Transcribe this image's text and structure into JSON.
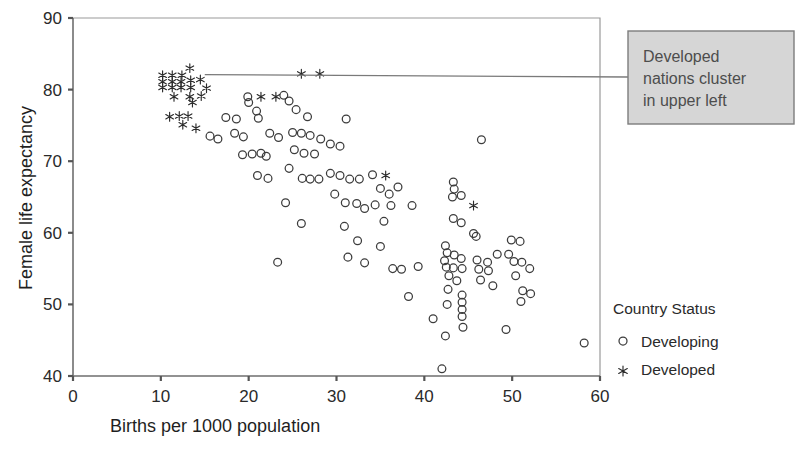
{
  "chart_data": {
    "type": "scatter",
    "title": "",
    "xlabel": "Births per 1000 population",
    "ylabel": "Female life expectancy",
    "xlim": [
      0,
      60
    ],
    "ylim": [
      40,
      90
    ],
    "xticks": [
      0,
      10,
      20,
      30,
      40,
      50,
      60
    ],
    "yticks": [
      40,
      50,
      60,
      70,
      80,
      90
    ],
    "grid": false,
    "legend": {
      "title": "Country Status",
      "position": "right",
      "entries": [
        {
          "label": "Developing",
          "marker": "open-circle"
        },
        {
          "label": "Developed",
          "marker": "asterisk"
        }
      ]
    },
    "annotations": [
      {
        "text_lines": [
          "Developed",
          "nations cluster",
          "in upper left"
        ],
        "box_fill": "#d6d6d6",
        "box_stroke": "#7d7d7d",
        "leader_from": [
          15.0,
          82.1
        ],
        "leader_to": [
          63.3,
          81.8
        ]
      }
    ],
    "series": [
      {
        "name": "Developed",
        "marker": "asterisk",
        "color": "#2b2b2b",
        "points": [
          [
            10.2,
            82.0
          ],
          [
            11.3,
            82.0
          ],
          [
            12.4,
            82.0
          ],
          [
            13.3,
            83.0
          ],
          [
            10.2,
            81.1
          ],
          [
            11.3,
            81.1
          ],
          [
            12.3,
            81.1
          ],
          [
            13.4,
            81.3
          ],
          [
            14.5,
            81.4
          ],
          [
            10.2,
            80.3
          ],
          [
            11.3,
            80.3
          ],
          [
            12.3,
            80.3
          ],
          [
            13.4,
            80.3
          ],
          [
            15.2,
            80.2
          ],
          [
            11.5,
            79.0
          ],
          [
            13.3,
            79.0
          ],
          [
            14.6,
            79.1
          ],
          [
            13.6,
            78.2
          ],
          [
            11.0,
            76.2
          ],
          [
            12.1,
            76.3
          ],
          [
            13.1,
            76.3
          ],
          [
            12.5,
            75.1
          ],
          [
            14.0,
            74.6
          ],
          [
            21.4,
            79.0
          ],
          [
            23.1,
            79.0
          ],
          [
            26.0,
            82.2
          ],
          [
            28.1,
            82.2
          ],
          [
            35.6,
            68.0
          ],
          [
            45.6,
            63.8
          ]
        ]
      },
      {
        "name": "Developing",
        "marker": "open-circle",
        "color": "#3c3c3c",
        "points": [
          [
            17.4,
            76.1
          ],
          [
            18.6,
            75.9
          ],
          [
            19.9,
            79.0
          ],
          [
            20.0,
            78.2
          ],
          [
            18.4,
            73.9
          ],
          [
            19.4,
            73.4
          ],
          [
            16.5,
            73.1
          ],
          [
            15.6,
            73.5
          ],
          [
            20.9,
            77.0
          ],
          [
            21.1,
            76.0
          ],
          [
            22.4,
            73.9
          ],
          [
            23.4,
            73.3
          ],
          [
            20.4,
            71.0
          ],
          [
            21.4,
            71.1
          ],
          [
            22.0,
            70.7
          ],
          [
            19.3,
            70.9
          ],
          [
            21.0,
            68.0
          ],
          [
            22.2,
            67.6
          ],
          [
            24.0,
            79.2
          ],
          [
            24.6,
            78.4
          ],
          [
            25.4,
            77.2
          ],
          [
            26.7,
            76.2
          ],
          [
            25.0,
            74.0
          ],
          [
            26.0,
            73.9
          ],
          [
            27.0,
            73.6
          ],
          [
            25.2,
            71.6
          ],
          [
            26.3,
            71.1
          ],
          [
            27.5,
            71.0
          ],
          [
            24.6,
            69.0
          ],
          [
            26.1,
            67.6
          ],
          [
            27.0,
            67.5
          ],
          [
            28.0,
            67.5
          ],
          [
            24.2,
            64.2
          ],
          [
            26.0,
            61.3
          ],
          [
            23.3,
            55.9
          ],
          [
            28.2,
            73.1
          ],
          [
            29.3,
            72.4
          ],
          [
            30.4,
            72.1
          ],
          [
            31.1,
            75.9
          ],
          [
            29.3,
            68.3
          ],
          [
            30.4,
            68.0
          ],
          [
            31.5,
            67.5
          ],
          [
            32.6,
            67.5
          ],
          [
            29.8,
            65.4
          ],
          [
            31.0,
            64.2
          ],
          [
            32.3,
            64.1
          ],
          [
            33.2,
            63.4
          ],
          [
            30.9,
            60.9
          ],
          [
            32.4,
            58.9
          ],
          [
            31.3,
            56.6
          ],
          [
            33.2,
            55.8
          ],
          [
            34.1,
            68.1
          ],
          [
            35.0,
            66.2
          ],
          [
            36.0,
            65.4
          ],
          [
            37.0,
            66.4
          ],
          [
            34.4,
            63.9
          ],
          [
            36.2,
            63.8
          ],
          [
            35.4,
            61.6
          ],
          [
            35.0,
            58.1
          ],
          [
            36.4,
            55.0
          ],
          [
            37.4,
            54.9
          ],
          [
            38.2,
            51.1
          ],
          [
            38.6,
            63.8
          ],
          [
            39.3,
            55.3
          ],
          [
            41.0,
            48.0
          ],
          [
            42.0,
            41.0
          ],
          [
            43.3,
            67.1
          ],
          [
            43.4,
            66.1
          ],
          [
            43.2,
            65.0
          ],
          [
            44.2,
            65.2
          ],
          [
            43.3,
            62.0
          ],
          [
            44.2,
            61.4
          ],
          [
            45.6,
            59.9
          ],
          [
            45.9,
            59.5
          ],
          [
            42.4,
            58.2
          ],
          [
            42.6,
            57.2
          ],
          [
            43.4,
            56.9
          ],
          [
            44.2,
            56.4
          ],
          [
            42.3,
            56.1
          ],
          [
            42.5,
            55.2
          ],
          [
            43.3,
            55.1
          ],
          [
            44.3,
            55.0
          ],
          [
            42.8,
            54.0
          ],
          [
            43.7,
            53.3
          ],
          [
            42.7,
            52.1
          ],
          [
            44.3,
            51.3
          ],
          [
            44.3,
            50.3
          ],
          [
            44.3,
            49.3
          ],
          [
            44.3,
            48.3
          ],
          [
            44.4,
            46.8
          ],
          [
            42.6,
            50.0
          ],
          [
            42.4,
            45.6
          ],
          [
            46.5,
            73.0
          ],
          [
            46.0,
            56.2
          ],
          [
            47.2,
            55.9
          ],
          [
            46.2,
            54.9
          ],
          [
            47.3,
            54.7
          ],
          [
            46.4,
            53.4
          ],
          [
            47.8,
            52.6
          ],
          [
            48.3,
            57.0
          ],
          [
            49.6,
            57.0
          ],
          [
            49.9,
            59.0
          ],
          [
            50.9,
            58.8
          ],
          [
            50.2,
            56.0
          ],
          [
            51.1,
            55.9
          ],
          [
            52.0,
            55.0
          ],
          [
            50.4,
            54.0
          ],
          [
            51.2,
            51.9
          ],
          [
            52.1,
            51.5
          ],
          [
            51.0,
            50.4
          ],
          [
            49.3,
            46.5
          ],
          [
            58.2,
            44.6
          ]
        ]
      }
    ]
  }
}
